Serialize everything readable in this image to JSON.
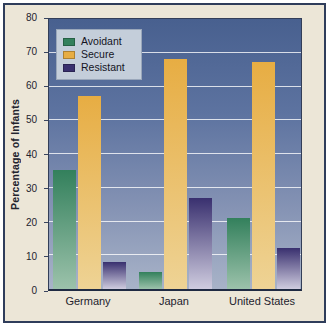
{
  "figure": {
    "y_axis_title": "Percentage of Infants",
    "background_color": "#ece6d7",
    "frame_color": "#2f3d5b",
    "plot_gradient_top": "#48608f",
    "plot_gradient_bottom": "#a8b3c8"
  },
  "chart_data": {
    "type": "bar",
    "title": "",
    "xlabel": "",
    "ylabel": "Percentage of Infants",
    "categories": [
      "Germany",
      "Japan",
      "United States"
    ],
    "series": [
      {
        "name": "Avoidant",
        "color_top": "#33805c",
        "color_bottom": "#9cc2ab",
        "values": [
          35,
          5,
          21
        ]
      },
      {
        "name": "Secure",
        "color_top": "#e7ad43",
        "color_bottom": "#eed395",
        "values": [
          57,
          68,
          67
        ]
      },
      {
        "name": "Resistant",
        "color_top": "#39306f",
        "color_bottom": "#cfccdf",
        "values": [
          8,
          27,
          12
        ]
      }
    ],
    "ylim": [
      0,
      80
    ],
    "ytick_step": 10,
    "yticks": [
      0,
      10,
      20,
      30,
      40,
      50,
      60,
      70,
      80
    ],
    "grid": true,
    "gridline_color": "#ffffff",
    "legend_position": "top-left"
  }
}
